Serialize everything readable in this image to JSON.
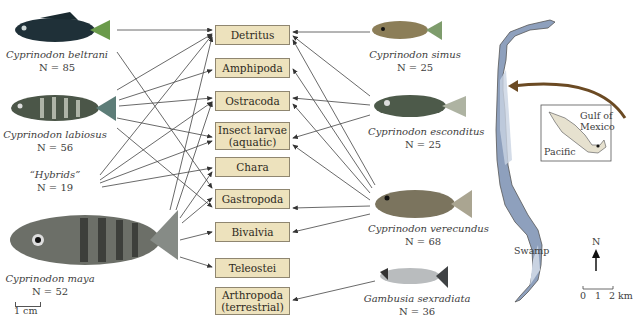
{
  "figure": {
    "type": "food-web-diagram",
    "left_species": [
      {
        "name": "Cyprinodon beltrani",
        "n_label": "N = 85",
        "n": 85
      },
      {
        "name": "Cyprinodon labiosus",
        "n_label": "N = 56",
        "n": 56
      },
      {
        "name": "“Hybrids”",
        "n_label": "N = 19",
        "n": 19
      },
      {
        "name": "Cyprinodon maya",
        "n_label": "N = 52",
        "n": 52
      }
    ],
    "right_species": [
      {
        "name": "Cyprinodon simus",
        "n_label": "N = 25",
        "n": 25
      },
      {
        "name": "Cyprinodon esconditus",
        "n_label": "N = 25",
        "n": 25
      },
      {
        "name": "Cyprinodon verecundus",
        "n_label": "N = 68",
        "n": 68
      },
      {
        "name": "Gambusia sexradiata",
        "n_label": "N = 36",
        "n": 36
      }
    ],
    "prey_categories": [
      {
        "line1": "Detritus",
        "line2": ""
      },
      {
        "line1": "Amphipoda",
        "line2": ""
      },
      {
        "line1": "Ostracoda",
        "line2": ""
      },
      {
        "line1": "Insect larvae",
        "line2": "(aquatic)"
      },
      {
        "line1": "Chara",
        "line2": ""
      },
      {
        "line1": "Gastropoda",
        "line2": ""
      },
      {
        "line1": "Bivalvia",
        "line2": ""
      },
      {
        "line1": "Teleostei",
        "line2": ""
      },
      {
        "line1": "Arthropoda",
        "line2": "(terrestrial)"
      }
    ],
    "scale_bar_fish": "1 cm",
    "map": {
      "inset_labels": {
        "gulf": "Gulf of",
        "gulf2": "Mexico",
        "pacific": "Pacific"
      },
      "swamp_label": "Swamp",
      "north_label": "N",
      "scale_ticks": [
        "0",
        "1",
        "2 km"
      ]
    },
    "colors": {
      "prey_box_fill": "#ede2bd",
      "prey_box_border": "#8f8670",
      "arrow": "#333333",
      "lake_water": "#8ea0bd",
      "lake_shallow": "#c9d3e2",
      "inset_land": "#e6e1cf",
      "locator_arrow": "#6b4a23"
    }
  }
}
